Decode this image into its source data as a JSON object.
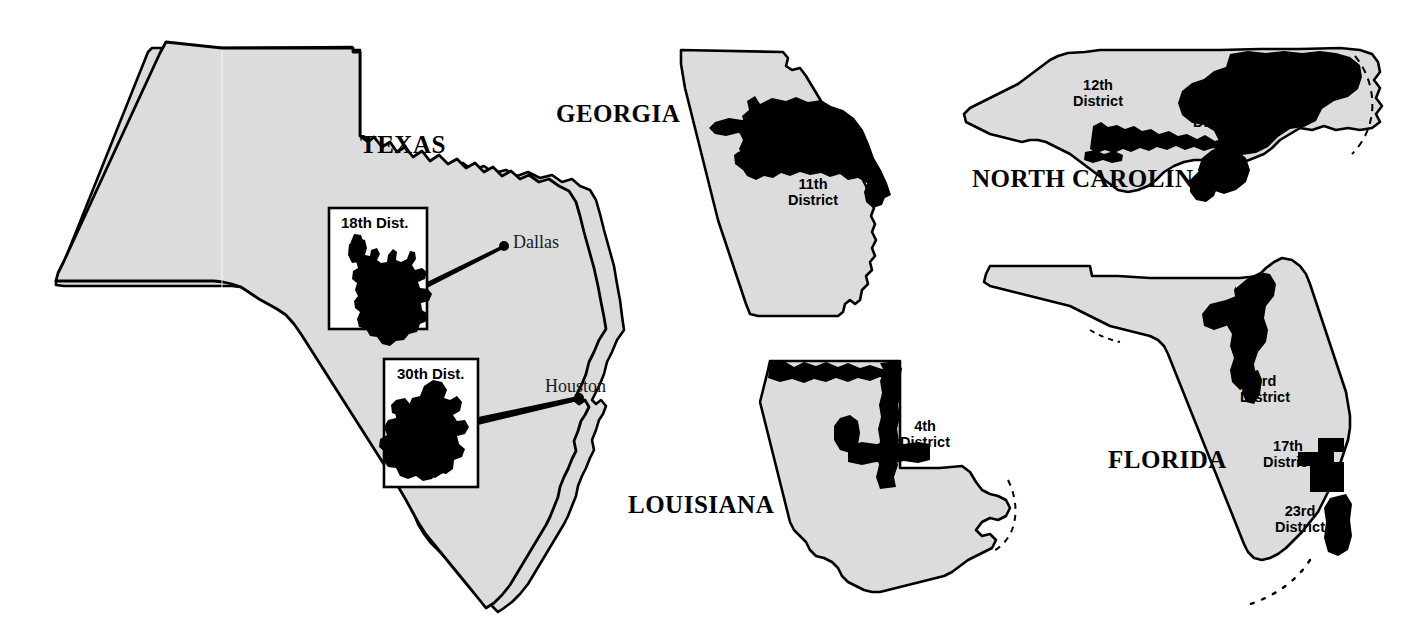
{
  "figure": {
    "background_color": "#ffffff",
    "state_fill_color": "#dcdcdc",
    "district_fill_color": "#000000",
    "outline_color": "#000000"
  },
  "states": [
    {
      "id": "texas",
      "label": "TEXAS",
      "districts": [
        {
          "id": "tx-18",
          "inset_title": "18th Dist.",
          "city": "Dallas"
        },
        {
          "id": "tx-30",
          "inset_title": "30th Dist.",
          "city": "Houston"
        }
      ]
    },
    {
      "id": "georgia",
      "label": "GEORGIA",
      "districts": [
        {
          "id": "ga-11",
          "line1": "11th",
          "line2": "District"
        }
      ]
    },
    {
      "id": "north-carolina",
      "label": "NORTH CAROLINA",
      "districts": [
        {
          "id": "nc-12",
          "line1": "12th",
          "line2": "District"
        },
        {
          "id": "nc-1",
          "line1": "1st",
          "line2": "District"
        }
      ]
    },
    {
      "id": "louisiana",
      "label": "LOUISIANA",
      "districts": [
        {
          "id": "la-4",
          "line1": "4th",
          "line2": "District"
        }
      ]
    },
    {
      "id": "florida",
      "label": "FLORIDA",
      "districts": [
        {
          "id": "fl-3",
          "line1": "3rd",
          "line2": "District"
        },
        {
          "id": "fl-17",
          "line1": "17th",
          "line2": "District"
        },
        {
          "id": "fl-23",
          "line1": "23rd",
          "line2": "District"
        }
      ]
    }
  ],
  "labels": {
    "texas": "TEXAS",
    "georgia": "GEORGIA",
    "north_carolina": "NORTH CAROLINA",
    "louisiana": "LOUISIANA",
    "florida": "FLORIDA",
    "tx_18_inset": "18th Dist.",
    "tx_30_inset": "30th Dist.",
    "dallas": "Dallas",
    "houston": "Houston",
    "ga_11_line1": "11th",
    "ga_11_line2": "District",
    "nc_12_line1": "12th",
    "nc_12_line2": "District",
    "nc_1_line1": "1st",
    "nc_1_line2": "District",
    "la_4_line1": "4th",
    "la_4_line2": "District",
    "fl_3_line1": "3rd",
    "fl_3_line2": "District",
    "fl_17_line1": "17th",
    "fl_17_line2": "District",
    "fl_23_line1": "23rd",
    "fl_23_line2": "District"
  }
}
